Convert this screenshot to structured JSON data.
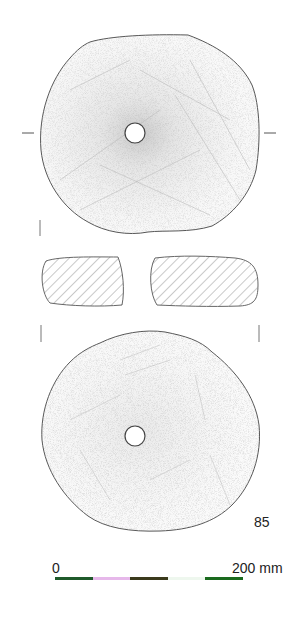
{
  "figure": {
    "catalogue_number": "85",
    "views": [
      "top-face",
      "cross-section",
      "bottom-face"
    ]
  },
  "scale": {
    "start_label": "0",
    "end_label": "200 mm",
    "segments": [
      {
        "color": "#1f5a2a"
      },
      {
        "color": "#e6b8ea"
      },
      {
        "color": "#3b3a1c"
      },
      {
        "color": "#eef7ee"
      },
      {
        "color": "#1a6a1e"
      }
    ]
  },
  "colors": {
    "outline": "#555555",
    "stipple": "#888888",
    "hatch": "#777777",
    "background": "#ffffff"
  }
}
